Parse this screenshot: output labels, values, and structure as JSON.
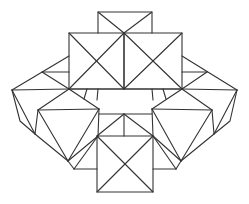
{
  "diagram": {
    "title": "",
    "stroke_color": "#333333",
    "background_color": "#ffffff",
    "components": [
      {
        "name": "top-small-square",
        "kind": "square-with-half-x"
      },
      {
        "name": "upper-left-square",
        "kind": "square-with-x"
      },
      {
        "name": "upper-right-square",
        "kind": "square-with-x"
      },
      {
        "name": "left-flap",
        "kind": "triangular-flap"
      },
      {
        "name": "right-flap",
        "kind": "triangular-flap"
      },
      {
        "name": "middle-band",
        "kind": "rectangle"
      },
      {
        "name": "left-kite",
        "kind": "pentagon-with-diagonals"
      },
      {
        "name": "right-kite",
        "kind": "pentagon-with-diagonals"
      },
      {
        "name": "lower-trapezoid",
        "kind": "triangle-subdivided"
      },
      {
        "name": "bottom-square",
        "kind": "square-with-x"
      }
    ]
  }
}
